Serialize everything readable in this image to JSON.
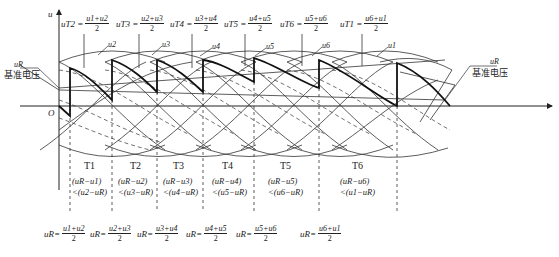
{
  "axes": {
    "y_label": "u",
    "origin_label": "O"
  },
  "reference": {
    "symbol": "u_R",
    "label_left_sym": "uR",
    "label_left_text": "基准电压",
    "label_right_sym": "uR",
    "label_right_text": "基准电压"
  },
  "top_equations": [
    {
      "lhs": "uT2 =",
      "num": "u1+u2",
      "den": "2"
    },
    {
      "lhs": "uT3 =",
      "num": "u2+u3",
      "den": "2"
    },
    {
      "lhs": "uT4 =",
      "num": "u3+u4",
      "den": "2"
    },
    {
      "lhs": "uT5 =",
      "num": "u4+u5",
      "den": "2"
    },
    {
      "lhs": "uT6 =",
      "num": "u5+u6",
      "den": "2"
    },
    {
      "lhs": "uT1 =",
      "num": "u6+u1",
      "den": "2"
    }
  ],
  "curve_labels": [
    "u2",
    "u3",
    "u4",
    "u5",
    "u6",
    "u1"
  ],
  "intervals": [
    {
      "name": "T1",
      "cond1": "(uR−u1)",
      "cond2": "<(u2−uR)"
    },
    {
      "name": "T2",
      "cond1": "(uR−u2)",
      "cond2": "<(u3−uR)"
    },
    {
      "name": "T3",
      "cond1": "(uR−u3)",
      "cond2": "<(u4−uR)"
    },
    {
      "name": "T4",
      "cond1": "(uR−u4)",
      "cond2": "<(u5−uR)"
    },
    {
      "name": "T5",
      "cond1": "(uR−u5)",
      "cond2": "<(u6−uR)"
    },
    {
      "name": "T6",
      "cond1": "(uR−u6)",
      "cond2": "<(u1−uR)"
    }
  ],
  "bottom_equations": [
    {
      "lhs": "uR=",
      "num": "u1+u2",
      "den": "2"
    },
    {
      "lhs": "uR=",
      "num": "u2+u3",
      "den": "2"
    },
    {
      "lhs": "uR=",
      "num": "u3+u4",
      "den": "2"
    },
    {
      "lhs": "uR=",
      "num": "u4+u5",
      "den": "2"
    },
    {
      "lhs": "uR=",
      "num": "u5+u6",
      "den": "2"
    },
    {
      "lhs": "uR=",
      "num": "u6+u1",
      "den": "2"
    }
  ]
}
